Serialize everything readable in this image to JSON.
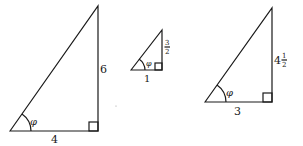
{
  "diagram": {
    "angle_label": "φ",
    "triangles": [
      {
        "id": "large-left",
        "base": "4",
        "height": "6"
      },
      {
        "id": "small-middle",
        "base": "1",
        "height_num": "3",
        "height_den": "2"
      },
      {
        "id": "right",
        "base": "3",
        "height_whole": "4",
        "height_num": "1",
        "height_den": "2"
      }
    ]
  }
}
